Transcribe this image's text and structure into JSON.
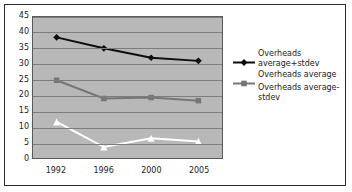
{
  "chart_data": {
    "type": "line",
    "title": "",
    "xlabel": "",
    "ylabel": "",
    "categories": [
      "1992",
      "1996",
      "2000",
      "2005"
    ],
    "ylim": [
      0,
      45
    ],
    "ytick_labels": [
      "0",
      "5",
      "10",
      "15",
      "20",
      "25",
      "30",
      "35",
      "40",
      "45"
    ],
    "ytick_values": [
      0,
      5,
      10,
      15,
      20,
      25,
      30,
      35,
      40,
      45
    ],
    "grid": true,
    "legend_position": "right",
    "plot_background": "#b8b8b8",
    "series": [
      {
        "name": "Overheads average+stdev",
        "values": [
          38.5,
          35.0,
          32.0,
          31.0
        ],
        "color": "#0d0d0d",
        "marker": "diamond",
        "marker_color": "#0d0d0d"
      },
      {
        "name": "Overheads average",
        "values": [
          24.8,
          19.0,
          19.3,
          18.3
        ],
        "color": "#767676",
        "marker": "square",
        "marker_color": "#767676"
      },
      {
        "name": "Overheads average-stdev",
        "values": [
          11.5,
          3.5,
          6.3,
          5.3
        ],
        "color": "#ffffff",
        "marker": "triangle",
        "marker_color": "#ffffff"
      }
    ]
  },
  "legend": {
    "entries": [
      {
        "label": "Overheads average+stdev",
        "marker": "diamond-icon"
      },
      {
        "label": "Overheads average",
        "marker": "square-icon"
      },
      {
        "label": "Overheads average-stdev",
        "marker": "triangle-icon"
      }
    ]
  }
}
